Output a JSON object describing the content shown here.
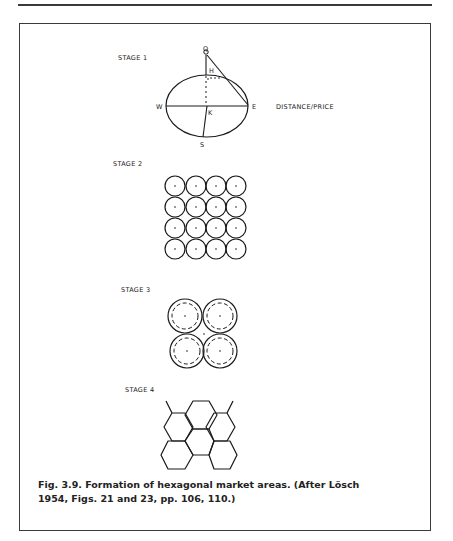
{
  "figure": {
    "stages": [
      {
        "label": "STAGE 1"
      },
      {
        "label": "STAGE 2"
      },
      {
        "label": "STAGE 3"
      },
      {
        "label": "STAGE 4"
      }
    ],
    "stage1_points": {
      "q": "Q",
      "h": "H",
      "w": "W",
      "e": "E",
      "k": "K",
      "s": "S"
    },
    "stage1_axis_label": "DISTANCE/PRICE",
    "caption_line1": "Fig. 3.9.  Formation of hexagonal market areas. (After Lösch",
    "caption_line2": "1954, Figs. 21 and 23, pp. 106, 110.)"
  },
  "colors": {
    "ink": "#1a1a1a",
    "frame": "#3a3a3a",
    "background": "#ffffff"
  }
}
